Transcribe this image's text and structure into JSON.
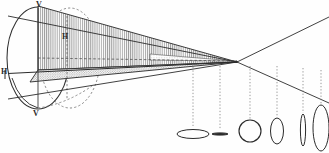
{
  "figure": {
    "background_color": "#fefefe",
    "ink_color": "#2b2b2b",
    "hatch_color": "#8c8c8c",
    "stipple_color": "#a5a5a5",
    "labels": [
      {
        "id": "v-top",
        "text": "V",
        "x": 36,
        "y": 2,
        "font_size": 8,
        "role": "vertical-extreme-upper"
      },
      {
        "id": "h-inner",
        "text": "H",
        "x": 62,
        "y": 33,
        "font_size": 8,
        "role": "horizontal-axis-inner"
      },
      {
        "id": "h-left",
        "text": "H",
        "x": 1,
        "y": 68,
        "font_size": 8,
        "role": "horizontal-extreme-left"
      },
      {
        "id": "v-bottom",
        "text": "V",
        "x": 33,
        "y": 110,
        "font_size": 8,
        "role": "vertical-extreme-lower"
      }
    ],
    "apex": {
      "x": 237,
      "y": 62,
      "label": ""
    },
    "base_ellipse": {
      "cx": 38,
      "cy": 58,
      "rx": 32,
      "ry": 52
    },
    "cross_sections": [
      {
        "id": "section-1",
        "shape": "flat-ellipse",
        "cx": 193,
        "cy": 134,
        "rx": 16,
        "ry": 4.5,
        "drop_line_x": 193,
        "drop_line_top": 64
      },
      {
        "id": "section-2",
        "shape": "degenerate-line",
        "cx": 220,
        "cy": 134,
        "rx": 8,
        "ry": 1.2,
        "drop_line_x": 220,
        "drop_line_top": 66
      },
      {
        "id": "section-3",
        "shape": "circle",
        "cx": 250,
        "cy": 131,
        "rx": 11,
        "ry": 11,
        "drop_line_x": 250,
        "drop_line_top": 66
      },
      {
        "id": "section-4",
        "shape": "tall-ellipse",
        "cx": 277,
        "cy": 131,
        "rx": 6.5,
        "ry": 13,
        "drop_line_x": 277,
        "drop_line_top": 66
      },
      {
        "id": "section-5",
        "shape": "narrow-ellipse",
        "cx": 303,
        "cy": 130,
        "rx": 2.6,
        "ry": 16,
        "drop_line_x": 303,
        "drop_line_top": 68
      },
      {
        "id": "section-6",
        "shape": "tallest-ellipse",
        "cx": 321,
        "cy": 128,
        "rx": 8,
        "ry": 23,
        "drop_line_x": 321,
        "drop_line_top": 70
      }
    ],
    "rays": [
      {
        "id": "ray-upper-front",
        "from_x": 8,
        "from_y": 16,
        "to_x": 237,
        "to_y": 62
      },
      {
        "id": "ray-lower-front",
        "from_x": 8,
        "from_y": 98,
        "to_x": 237,
        "to_y": 62
      },
      {
        "id": "ray-upper-rear",
        "from_x": 237,
        "from_y": 62,
        "to_x": 329,
        "to_y": 18
      },
      {
        "id": "ray-lower-rear",
        "from_x": 237,
        "from_y": 62,
        "to_x": 329,
        "to_y": 104
      }
    ]
  }
}
